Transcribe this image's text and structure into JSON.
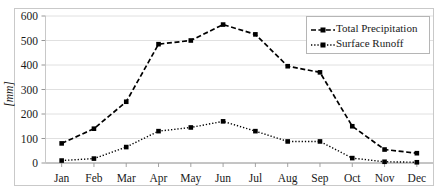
{
  "chart_data": {
    "type": "line",
    "title": "",
    "xlabel": "",
    "ylabel": "[mm]",
    "categories": [
      "Jan",
      "Feb",
      "Mar",
      "Apr",
      "May",
      "Jun",
      "Jul",
      "Aug",
      "Sep",
      "Oct",
      "Nov",
      "Dec"
    ],
    "series": [
      {
        "name": "Total Precipitation",
        "values": [
          80,
          140,
          250,
          485,
          500,
          565,
          525,
          395,
          370,
          150,
          55,
          40
        ],
        "color": "#000000",
        "line_style": "dashed",
        "marker": "square"
      },
      {
        "name": "Surface Runoff",
        "values": [
          10,
          18,
          65,
          130,
          145,
          170,
          130,
          88,
          88,
          20,
          5,
          3
        ],
        "color": "#000000",
        "line_style": "dotted",
        "marker": "square"
      }
    ],
    "ylim": [
      0,
      600
    ],
    "yticks": [
      0,
      100,
      200,
      300,
      400,
      500,
      600
    ],
    "ytick_labels": [
      "0",
      "100",
      "200",
      "300",
      "400",
      "500",
      "600"
    ],
    "grid": true,
    "grid_axis": "y",
    "legend_position": "top-right",
    "legend_entries": [
      "Total Precipitation",
      "Surface Runoff"
    ]
  },
  "axes": {
    "y_axis_title": "[mm]"
  },
  "legend": {
    "items": [
      {
        "label": "Total Precipitation"
      },
      {
        "label": "Surface Runoff"
      }
    ]
  }
}
